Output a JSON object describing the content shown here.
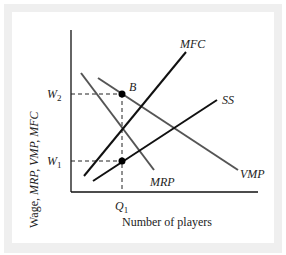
{
  "axes": {
    "y_label_prefix": "Wage, ",
    "y_label_italic": "MRP, VMP, MFC",
    "x_label": "Number of players"
  },
  "ticks": {
    "w2": "W",
    "w2_sub": "2",
    "w1": "W",
    "w1_sub": "1",
    "q1": "Q",
    "q1_sub": "1"
  },
  "curves": {
    "mfc": "MFC",
    "ss": "SS",
    "mrp": "MRP",
    "vmp": "VMP"
  },
  "points": {
    "b": "B"
  },
  "colors": {
    "frame": "#efefef",
    "dark_line": "#111111",
    "gray_line": "#555555"
  }
}
